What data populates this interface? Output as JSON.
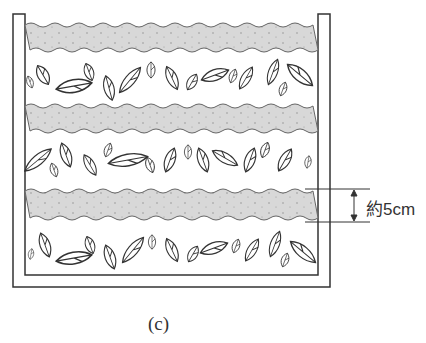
{
  "figure": {
    "caption": "(c)",
    "dimension_label": "約5cm",
    "layers": [
      "soil",
      "leaves",
      "soil",
      "leaves",
      "soil",
      "leaves"
    ],
    "colors": {
      "soil": "#d6d6d6",
      "line": "#333333"
    }
  }
}
